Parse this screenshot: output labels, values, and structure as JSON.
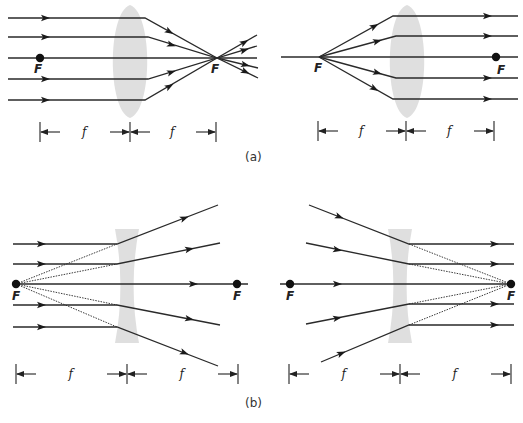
{
  "figure": {
    "caption_a": "(a)",
    "caption_b": "(b)",
    "focal_label": "F",
    "distance_label": "f",
    "colors": {
      "ray": "#2a2a2a",
      "lens": "#d9d9d9",
      "dot": "#111111"
    }
  },
  "panels": [
    {
      "id": "a-left",
      "description": "Converging lens: parallel rays converge at right focal point",
      "lens_type": "convex",
      "lens": {
        "cx": 130,
        "top": 5,
        "bottom": 118,
        "half_width": 17
      },
      "axis_y": 58,
      "focal_points": [
        {
          "x": 40,
          "y": 58,
          "dot": true,
          "label_dx": -6,
          "label_dy": 15
        },
        {
          "x": 217,
          "y": 58,
          "dot": false,
          "label_dx": -6,
          "label_dy": 15
        }
      ],
      "dimension": {
        "y": 132,
        "ticks": [
          40,
          130,
          216
        ]
      }
    },
    {
      "id": "a-right",
      "description": "Converging lens: rays from left focal point emerge parallel",
      "lens_type": "convex",
      "lens": {
        "cx": 407,
        "top": 5,
        "bottom": 118,
        "half_width": 17
      },
      "axis_y": 57,
      "focal_points": [
        {
          "x": 319,
          "y": 57,
          "dot": false,
          "label_dx": -5,
          "label_dy": 15
        },
        {
          "x": 496,
          "y": 57,
          "dot": true,
          "label_dx": 1,
          "label_dy": 17
        }
      ],
      "dimension": {
        "y": 131,
        "ticks": [
          318,
          406,
          494
        ]
      }
    },
    {
      "id": "b-left",
      "description": "Diverging lens: parallel rays diverge as if from left focal point",
      "lens_type": "concave",
      "lens": {
        "cx": 127,
        "top": 229,
        "bottom": 343,
        "half_width": 12
      },
      "axis_y": 284,
      "focal_points": [
        {
          "x": 16,
          "y": 284,
          "dot": true,
          "label_dx": -4,
          "label_dy": 16
        },
        {
          "x": 237,
          "y": 284,
          "dot": true,
          "label_dx": -4,
          "label_dy": 16
        }
      ],
      "dimension": {
        "y": 374,
        "ticks": [
          16,
          127,
          238
        ]
      }
    },
    {
      "id": "b-right",
      "description": "Diverging lens: rays aimed at right focal point emerge parallel",
      "lens_type": "concave",
      "lens": {
        "cx": 400,
        "top": 229,
        "bottom": 343,
        "half_width": 12
      },
      "axis_y": 284,
      "focal_points": [
        {
          "x": 290,
          "y": 284,
          "dot": true,
          "label_dx": -4,
          "label_dy": 16
        },
        {
          "x": 511,
          "y": 284,
          "dot": true,
          "label_dx": -4,
          "label_dy": 16
        }
      ],
      "dimension": {
        "y": 374,
        "ticks": [
          289,
          400,
          511
        ]
      }
    }
  ],
  "rays": {
    "a-left": [
      {
        "pts": [
          [
            8,
            18
          ],
          [
            145,
            18
          ],
          [
            217,
            58
          ],
          [
            257,
            35
          ]
        ],
        "arrows": [
          [
            46,
            18,
            0
          ],
          [
            170,
            32,
            1
          ],
          [
            245,
            42,
            1
          ]
        ]
      },
      {
        "pts": [
          [
            8,
            37
          ],
          [
            148,
            37
          ],
          [
            217,
            58
          ],
          [
            257,
            46
          ]
        ],
        "arrows": [
          [
            46,
            37,
            0
          ],
          [
            172,
            45,
            1
          ],
          [
            245,
            50,
            1
          ]
        ]
      },
      {
        "pts": [
          [
            8,
            58
          ],
          [
            257,
            58
          ]
        ],
        "arrows": []
      },
      {
        "pts": [
          [
            8,
            79
          ],
          [
            148,
            79
          ],
          [
            217,
            58
          ],
          [
            258,
            68
          ]
        ],
        "arrows": [
          [
            46,
            79,
            0
          ],
          [
            172,
            72,
            1
          ],
          [
            246,
            65,
            1
          ]
        ]
      },
      {
        "pts": [
          [
            8,
            100
          ],
          [
            145,
            100
          ],
          [
            217,
            58
          ],
          [
            258,
            78
          ]
        ],
        "arrows": [
          [
            46,
            100,
            0
          ],
          [
            170,
            86,
            1
          ],
          [
            246,
            72,
            1
          ]
        ]
      }
    ],
    "a-right": [
      {
        "pts": [
          [
            319,
            57
          ],
          [
            393,
            16
          ],
          [
            518,
            16
          ]
        ],
        "arrows": [
          [
            375,
            26,
            1
          ],
          [
            488,
            16,
            0
          ]
        ]
      },
      {
        "pts": [
          [
            319,
            57
          ],
          [
            396,
            36
          ],
          [
            518,
            36
          ]
        ],
        "arrows": [
          [
            378,
            41,
            1
          ],
          [
            488,
            36,
            0
          ]
        ]
      },
      {
        "pts": [
          [
            281,
            57
          ],
          [
            518,
            57
          ]
        ],
        "arrows": []
      },
      {
        "pts": [
          [
            319,
            57
          ],
          [
            396,
            78
          ],
          [
            518,
            78
          ]
        ],
        "arrows": [
          [
            378,
            73,
            1
          ],
          [
            488,
            78,
            0
          ]
        ]
      },
      {
        "pts": [
          [
            319,
            57
          ],
          [
            393,
            99
          ],
          [
            518,
            99
          ]
        ],
        "arrows": [
          [
            375,
            89,
            1
          ],
          [
            488,
            99,
            0
          ]
        ]
      }
    ],
    "b-left": [
      {
        "pts": [
          [
            13,
            244
          ],
          [
            117,
            244
          ],
          [
            218,
            205
          ]
        ],
        "arrows": [
          [
            42,
            244,
            0
          ],
          [
            185,
            218,
            1
          ]
        ],
        "virtual": [
          [
            16,
            284
          ],
          [
            117,
            244
          ]
        ]
      },
      {
        "pts": [
          [
            13,
            264
          ],
          [
            117,
            264
          ],
          [
            220,
            243
          ]
        ],
        "arrows": [
          [
            42,
            264,
            0
          ],
          [
            190,
            249,
            1
          ]
        ],
        "virtual": [
          [
            16,
            284
          ],
          [
            117,
            264
          ]
        ]
      },
      {
        "pts": [
          [
            13,
            284
          ],
          [
            248,
            284
          ]
        ],
        "arrows": [
          [
            194,
            284,
            0
          ]
        ]
      },
      {
        "pts": [
          [
            13,
            305
          ],
          [
            117,
            305
          ],
          [
            220,
            325
          ]
        ],
        "arrows": [
          [
            42,
            305,
            0
          ],
          [
            190,
            319,
            1
          ]
        ],
        "virtual": [
          [
            16,
            284
          ],
          [
            117,
            305
          ]
        ]
      },
      {
        "pts": [
          [
            13,
            327
          ],
          [
            117,
            327
          ],
          [
            218,
            366
          ]
        ],
        "arrows": [
          [
            42,
            327,
            0
          ],
          [
            185,
            353,
            1
          ]
        ],
        "virtual": [
          [
            16,
            284
          ],
          [
            117,
            327
          ]
        ]
      }
    ],
    "b-right": [
      {
        "pts": [
          [
            309,
            205
          ],
          [
            409,
            244
          ],
          [
            514,
            244
          ]
        ],
        "arrows": [
          [
            340,
            217,
            1
          ],
          [
            495,
            244,
            0
          ]
        ],
        "virtual": [
          [
            409,
            244
          ],
          [
            511,
            284
          ]
        ]
      },
      {
        "pts": [
          [
            306,
            243
          ],
          [
            409,
            264
          ],
          [
            514,
            264
          ]
        ],
        "arrows": [
          [
            338,
            250,
            1
          ],
          [
            495,
            264,
            0
          ]
        ],
        "virtual": [
          [
            409,
            264
          ],
          [
            511,
            284
          ]
        ]
      },
      {
        "pts": [
          [
            280,
            284
          ],
          [
            511,
            284
          ]
        ],
        "arrows": [
          [
            338,
            284,
            0
          ]
        ]
      },
      {
        "pts": [
          [
            306,
            324
          ],
          [
            409,
            304
          ],
          [
            514,
            304
          ]
        ],
        "arrows": [
          [
            338,
            318,
            1
          ],
          [
            495,
            304,
            0
          ]
        ],
        "virtual": [
          [
            409,
            304
          ],
          [
            511,
            284
          ]
        ]
      },
      {
        "pts": [
          [
            321,
            362
          ],
          [
            409,
            325
          ],
          [
            514,
            325
          ]
        ],
        "arrows": [
          [
            342,
            353,
            1
          ],
          [
            495,
            325,
            0
          ]
        ],
        "virtual": [
          [
            409,
            325
          ],
          [
            511,
            284
          ]
        ]
      }
    ]
  }
}
